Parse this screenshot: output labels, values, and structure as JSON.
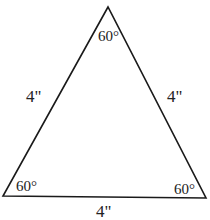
{
  "diagram": {
    "vertices": {
      "top": [
        108,
        7
      ],
      "bottom_left": [
        3,
        196
      ],
      "bottom_right": [
        206,
        198
      ]
    },
    "angles": {
      "top": "60°",
      "bottom_left": "60°",
      "bottom_right": "60°"
    },
    "sides": {
      "left": "4\"",
      "right": "4\"",
      "bottom": "4\""
    },
    "stroke_color": "#1a1a1a"
  }
}
